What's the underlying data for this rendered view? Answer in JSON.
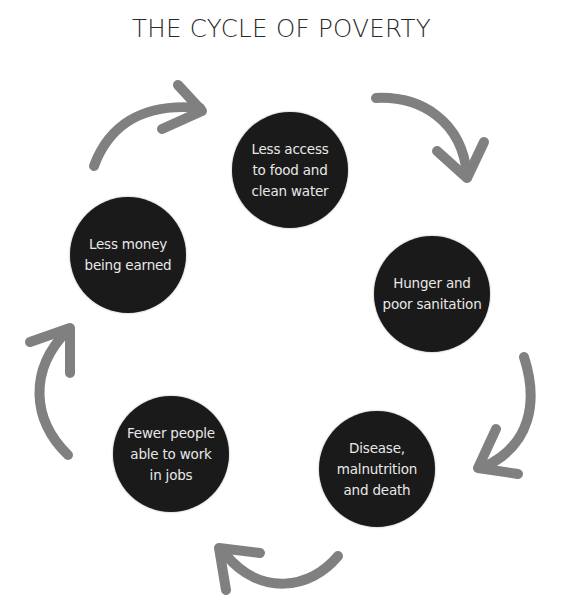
{
  "title": "THE CYCLE OF POVERTY",
  "colors": {
    "circle_fill": "#1a1a1a",
    "circle_text": "#e8e8e8",
    "arrow": "#808080",
    "title": "#2a2a2a"
  },
  "nodes": [
    {
      "id": "food-water",
      "label": "Less access\nto food and\nclean water",
      "cx": 290,
      "cy": 170,
      "r": 58
    },
    {
      "id": "hunger",
      "label": "Hunger and\npoor sanitation",
      "cx": 432,
      "cy": 294,
      "r": 58
    },
    {
      "id": "disease",
      "label": "Disease,\nmalnutrition\nand death",
      "cx": 377,
      "cy": 469,
      "r": 58
    },
    {
      "id": "fewer-workers",
      "label": "Fewer people\nable to work\nin jobs",
      "cx": 171,
      "cy": 454,
      "r": 58
    },
    {
      "id": "less-money",
      "label": "Less money\nbeing earned",
      "cx": 128,
      "cy": 255,
      "r": 58
    }
  ],
  "arrows": [
    {
      "from": "less-money",
      "to": "food-water",
      "direction": "clockwise"
    },
    {
      "from": "food-water",
      "to": "hunger",
      "direction": "clockwise"
    },
    {
      "from": "hunger",
      "to": "disease",
      "direction": "clockwise"
    },
    {
      "from": "disease",
      "to": "fewer-workers",
      "direction": "clockwise"
    },
    {
      "from": "fewer-workers",
      "to": "less-money",
      "direction": "clockwise"
    }
  ]
}
